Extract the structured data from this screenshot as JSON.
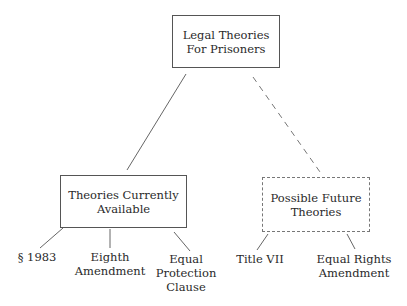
{
  "diagram": {
    "root": {
      "label_line1": "Legal Theories",
      "label_line2": "For Prisoners"
    },
    "current": {
      "label_line1": "Theories Currently",
      "label_line2": "Available",
      "children": [
        {
          "line1": "§ 1983",
          "line2": "",
          "line3": ""
        },
        {
          "line1": "Eighth",
          "line2": "Amendment",
          "line3": ""
        },
        {
          "line1": "Equal",
          "line2": "Protection",
          "line3": "Clause"
        }
      ]
    },
    "future": {
      "label_line1": "Possible Future",
      "label_line2": "Theories",
      "children": [
        {
          "line1": "Title VII",
          "line2": ""
        },
        {
          "line1": "Equal Rights",
          "line2": "Amendment"
        }
      ]
    }
  }
}
